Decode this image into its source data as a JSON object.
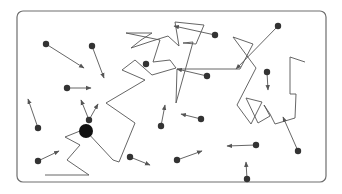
{
  "diagram": {
    "title": "",
    "frame": {
      "x": 17,
      "y": 11,
      "width": 309,
      "height": 171,
      "radius": 6,
      "stroke": "#6e6e6e"
    },
    "colors": {
      "line": "#555555",
      "particle": "#333333",
      "big_particle": "#111111",
      "background": "#ffffff"
    },
    "big_particle": {
      "x": 86,
      "y": 131,
      "r": 7
    },
    "random_walk_path": [
      [
        45,
        175
      ],
      [
        89,
        175
      ],
      [
        67,
        160
      ],
      [
        80,
        145
      ],
      [
        65,
        137
      ],
      [
        80,
        131
      ],
      [
        86,
        131
      ],
      [
        113,
        160
      ],
      [
        119,
        162
      ],
      [
        135,
        123
      ],
      [
        106,
        103
      ],
      [
        145,
        80
      ],
      [
        122,
        70
      ],
      [
        135,
        60
      ],
      [
        152,
        75
      ],
      [
        176,
        68
      ],
      [
        170,
        60
      ],
      [
        153,
        62
      ],
      [
        160,
        40
      ],
      [
        126,
        33
      ],
      [
        152,
        33
      ],
      [
        141,
        40
      ],
      [
        131,
        48
      ],
      [
        149,
        42
      ],
      [
        168,
        36
      ],
      [
        179,
        46
      ],
      [
        175,
        22
      ],
      [
        204,
        25
      ],
      [
        196,
        44
      ],
      [
        183,
        43
      ],
      [
        193,
        42
      ],
      [
        176,
        103
      ],
      [
        177,
        69
      ],
      [
        240,
        69
      ],
      [
        253,
        44
      ],
      [
        233,
        37
      ],
      [
        256,
        68
      ],
      [
        237,
        105
      ],
      [
        251,
        124
      ],
      [
        258,
        110
      ],
      [
        262,
        102
      ],
      [
        246,
        98
      ],
      [
        258,
        123
      ],
      [
        270,
        116
      ],
      [
        264,
        105
      ],
      [
        270,
        114
      ],
      [
        275,
        124
      ],
      [
        295,
        118
      ],
      [
        296,
        94
      ],
      [
        290,
        94
      ],
      [
        290,
        57
      ],
      [
        305,
        62
      ]
    ],
    "particles": [
      {
        "x": 46,
        "y": 44,
        "ax": 84,
        "ay": 68
      },
      {
        "x": 92,
        "y": 46,
        "ax": 104,
        "ay": 78
      },
      {
        "x": 67,
        "y": 88,
        "ax": 91,
        "ay": 88
      },
      {
        "x": 146,
        "y": 64,
        "ax": 146,
        "ay": 64
      },
      {
        "x": 215,
        "y": 35,
        "ax": 174,
        "ay": 26
      },
      {
        "x": 278,
        "y": 26,
        "ax": 236,
        "ay": 69
      },
      {
        "x": 207,
        "y": 76,
        "ax": 177,
        "ay": 69
      },
      {
        "x": 267,
        "y": 72,
        "ax": 268,
        "ay": 90
      },
      {
        "x": 38,
        "y": 128,
        "ax": 28,
        "ay": 99
      },
      {
        "x": 89,
        "y": 120,
        "ax": 81,
        "ay": 100
      },
      {
        "x": 89,
        "y": 120,
        "ax": 98,
        "ay": 104
      },
      {
        "x": 161,
        "y": 126,
        "ax": 165,
        "ay": 105
      },
      {
        "x": 201,
        "y": 119,
        "ax": 181,
        "ay": 114
      },
      {
        "x": 38,
        "y": 161,
        "ax": 59,
        "ay": 151
      },
      {
        "x": 130,
        "y": 157,
        "ax": 150,
        "ay": 165
      },
      {
        "x": 177,
        "y": 160,
        "ax": 202,
        "ay": 151
      },
      {
        "x": 256,
        "y": 145,
        "ax": 227,
        "ay": 146
      },
      {
        "x": 298,
        "y": 151,
        "ax": 283,
        "ay": 117
      },
      {
        "x": 247,
        "y": 179,
        "ax": 246,
        "ay": 162
      }
    ],
    "particle_radius": 3.2,
    "legend": []
  }
}
